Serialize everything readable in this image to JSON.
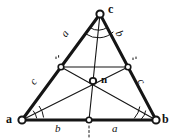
{
  "figure": {
    "ink_color": "#151515",
    "paper_color": "#ffffff",
    "width": 178,
    "height": 140
  },
  "vertices": [
    {
      "id": "a",
      "label": "a",
      "x": 22,
      "y": 120,
      "label_x": 6,
      "label_y": 113
    },
    {
      "id": "b",
      "label": "b",
      "x": 156,
      "y": 120,
      "label_x": 162,
      "label_y": 113
    },
    {
      "id": "c",
      "label": "c",
      "x": 100,
      "y": 14,
      "label_x": 108,
      "label_y": 3
    }
  ],
  "center": {
    "id": "n",
    "label": "n",
    "x": 93,
    "y": 81,
    "label_x": 101,
    "label_y": 74
  },
  "midpoints": [
    {
      "id": "mid-ac",
      "x": 61,
      "y": 67,
      "tick_x": 57,
      "tick_y": 58
    },
    {
      "id": "mid-bc",
      "x": 128,
      "y": 67,
      "tick_x": 134,
      "tick_y": 59
    },
    {
      "id": "mid-ab",
      "x": 89,
      "y": 120,
      "tick_x": 88,
      "tick_y": 127
    }
  ],
  "side_labels": [
    {
      "id": "side-ac-upper",
      "text": "a",
      "x": 62,
      "y": 28
    },
    {
      "id": "side-bc-upper",
      "text": "b",
      "x": 117,
      "y": 28
    },
    {
      "id": "side-ac-lower",
      "text": "c",
      "x": 31,
      "y": 76
    },
    {
      "id": "side-bc-lower",
      "text": "c",
      "x": 139,
      "y": 76
    },
    {
      "id": "side-ab-left",
      "text": "b",
      "x": 55,
      "y": 123
    },
    {
      "id": "side-ab-right",
      "text": "a",
      "x": 112,
      "y": 123
    }
  ],
  "angle_arcs": [
    {
      "id": "arc-a-outer",
      "vertex": "a",
      "radius": 22
    },
    {
      "id": "arc-a-inner",
      "vertex": "a",
      "radius": 15
    },
    {
      "id": "arc-b-outer",
      "vertex": "b",
      "radius": 22
    },
    {
      "id": "arc-b-inner",
      "vertex": "b",
      "radius": 15
    },
    {
      "id": "arc-c-outer",
      "vertex": "c",
      "radius": 22
    },
    {
      "id": "arc-c-inner",
      "vertex": "c",
      "radius": 15
    }
  ],
  "segments": {
    "sides": [
      "a-b",
      "a-c",
      "b-c"
    ],
    "medians": [
      "a-to-mid-bc",
      "b-to-mid-ac",
      "c-to-mid-ab"
    ],
    "midline": [
      "mid-ac-to-mid-bc"
    ]
  }
}
